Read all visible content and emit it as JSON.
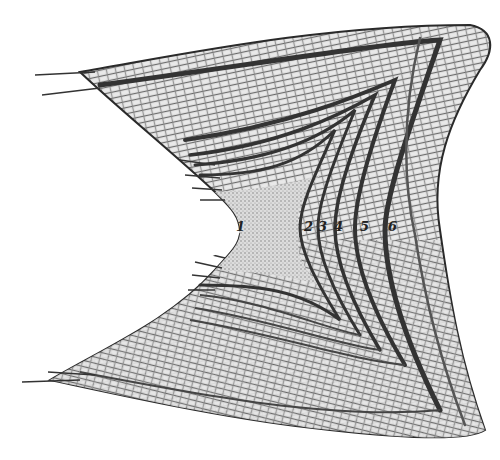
{
  "figure": {
    "background": "#ffffff",
    "ink_color": "#2a2a2a",
    "shade_light": "#d8d8d8",
    "shade_mid": "#a8a8a8",
    "shade_dark": "#555555"
  },
  "ring_labels": [
    {
      "text": "1",
      "x": 241,
      "y": 219
    },
    {
      "text": "2",
      "x": 306,
      "y": 219
    },
    {
      "text": "3",
      "x": 322,
      "y": 219
    },
    {
      "text": "4",
      "x": 337,
      "y": 219
    },
    {
      "text": "5",
      "x": 360,
      "y": 219
    },
    {
      "text": "6",
      "x": 390,
      "y": 219
    }
  ]
}
